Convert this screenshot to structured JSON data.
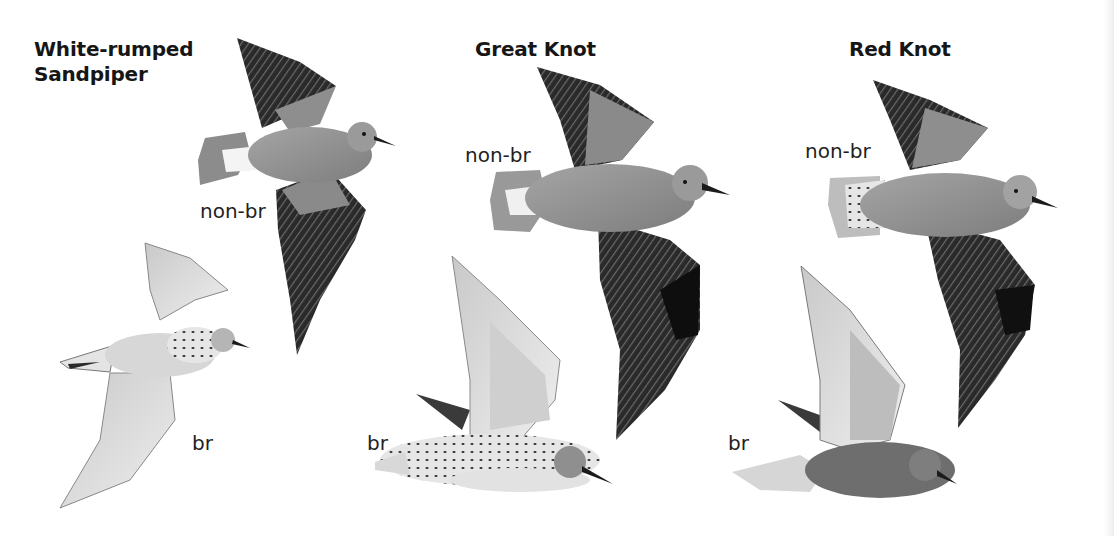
{
  "plate": {
    "species": [
      {
        "name_line1": "White-rumped",
        "name_line2": "Sandpiper",
        "figures": [
          {
            "plumage": "non-br",
            "view": "flight, upperwing"
          },
          {
            "plumage": "br",
            "view": "flight, underwing"
          }
        ]
      },
      {
        "name_line1": "Great Knot",
        "figures": [
          {
            "plumage": "non-br",
            "view": "flight, upperwing"
          },
          {
            "plumage": "br",
            "view": "flight, side"
          }
        ]
      },
      {
        "name_line1": "Red Knot",
        "figures": [
          {
            "plumage": "non-br",
            "view": "flight, upperwing"
          },
          {
            "plumage": "br",
            "view": "flight, side"
          }
        ]
      }
    ]
  },
  "colors": {
    "background": "#ffffff",
    "text": "#1a1a1a",
    "dark_wing": "#2a2a2a",
    "mid_grey": "#8a8a8a",
    "light_grey": "#d4d4d4"
  }
}
